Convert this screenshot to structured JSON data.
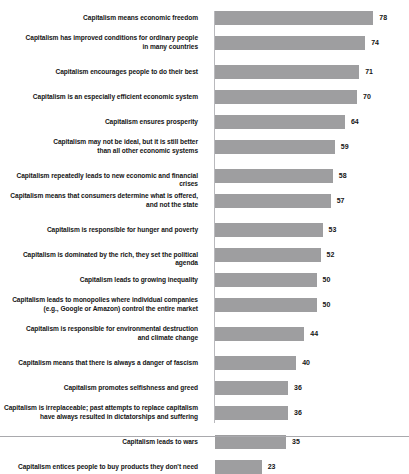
{
  "chart_data": {
    "type": "bar",
    "orientation": "horizontal",
    "title": "",
    "xlabel": "",
    "ylabel": "",
    "xlim": [
      0,
      80
    ],
    "grid": false,
    "legend": false,
    "bar_color": "#9e9ea0",
    "categories": [
      "Capitalism means economic freedom",
      "Capitalism has improved conditions for ordinary people in many countries",
      "Capitalism encourages people to do their best",
      "Capitalism is an especially efficient economic system",
      "Capitalism ensures prosperity",
      "Capitalism may not be ideal, but it is still better than all other economic systems",
      "Capitalism repeatedly leads to new economic and financial crises",
      "Capitalism means that consumers determine what is offered, and not the state",
      "Capitalism is responsible for hunger and poverty",
      "Capitalism is dominated by the rich, they set the political agenda",
      "Capitalism leads to growing inequality",
      "Capitalism leads to monopolies where individual companies (e.g., Google or Amazon) control the entire market",
      "Capitalism is responsible for environmental destruction and climate change",
      "Capitalism means that there is always a danger of fascism",
      "Capitalism promotes selfishness and greed",
      "Capitalism is irreplaceable; past attempts to replace capitalism have always resulted in dictatorships and suffering",
      "Capitalism leads to wars",
      "Capitalism entices people to buy products they don't need"
    ],
    "values": [
      78,
      74,
      71,
      70,
      64,
      59,
      58,
      57,
      53,
      52,
      50,
      50,
      44,
      40,
      36,
      36,
      35,
      23
    ]
  },
  "rows": [
    {
      "lines": [
        "Capitalism means economic freedom"
      ],
      "value": 78,
      "value_text": "78"
    },
    {
      "lines": [
        "Capitalism has improved conditions for ordinary people",
        "in many countries"
      ],
      "value": 74,
      "value_text": "74"
    },
    {
      "lines": [
        "Capitalism encourages people to do their best"
      ],
      "value": 71,
      "value_text": "71"
    },
    {
      "lines": [
        "Capitalism is an especially efficient economic system"
      ],
      "value": 70,
      "value_text": "70"
    },
    {
      "lines": [
        "Capitalism ensures prosperity"
      ],
      "value": 64,
      "value_text": "64"
    },
    {
      "lines": [
        "Capitalism may not be ideal, but it is still better",
        "than all other economic systems"
      ],
      "value": 59,
      "value_text": "59"
    },
    {
      "lines": [
        "Capitalism repeatedly leads to new economic and financial crises"
      ],
      "value": 58,
      "value_text": "58"
    },
    {
      "lines": [
        "Capitalism means that consumers determine what is offered,",
        "and not the state"
      ],
      "value": 57,
      "value_text": "57"
    },
    {
      "lines": [
        "Capitalism is responsible for hunger and poverty"
      ],
      "value": 53,
      "value_text": "53"
    },
    {
      "lines": [
        "Capitalism is dominated by the rich, they set the political agenda"
      ],
      "value": 52,
      "value_text": "52"
    },
    {
      "lines": [
        "Capitalism leads to growing inequality"
      ],
      "value": 50,
      "value_text": "50"
    },
    {
      "lines": [
        "Capitalism leads to monopolies where individual companies",
        "(e.g., Google or Amazon) control the entire market"
      ],
      "value": 50,
      "value_text": "50"
    },
    {
      "lines": [
        "Capitalism is responsible for environmental destruction",
        "and climate change"
      ],
      "value": 44,
      "value_text": "44"
    },
    {
      "lines": [
        "Capitalism means that there is always a danger of fascism"
      ],
      "value": 40,
      "value_text": "40"
    },
    {
      "lines": [
        "Capitalism promotes selfishness and greed"
      ],
      "value": 36,
      "value_text": "36"
    },
    {
      "lines": [
        "Capitalism is irreplaceable; past attempts to replace capitalism",
        "have always resulted in dictatorships and suffering"
      ],
      "value": 36,
      "value_text": "36"
    },
    {
      "lines": [
        "Capitalism leads to wars"
      ],
      "value": 35,
      "value_text": "35"
    },
    {
      "lines": [
        "Capitalism entices people to buy products they don't need"
      ],
      "value": 23,
      "value_text": "23"
    }
  ]
}
